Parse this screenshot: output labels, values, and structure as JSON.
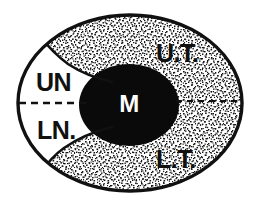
{
  "diagram": {
    "type": "anatomical-schematic",
    "background_color": "#ffffff",
    "outline_color": "#111111",
    "core_fill_color": "#0a0a0a",
    "core_text_color": "#ffffff",
    "stipple_color": "#151515",
    "plain_fill_color": "#ffffff",
    "labels": {
      "core": "M",
      "upper_right": "U.T.",
      "lower_right": "L.T.",
      "upper_left": "UN",
      "lower_left": "LN."
    },
    "regions": [
      {
        "id": "core",
        "label": "M",
        "fill": "solid-black",
        "location": "center"
      },
      {
        "id": "upper-tube",
        "label": "U.T.",
        "fill": "stippled",
        "location": "upper-right"
      },
      {
        "id": "lower-tube",
        "label": "L.T.",
        "fill": "stippled",
        "location": "lower-right"
      },
      {
        "id": "upper-notch",
        "label": "UN",
        "fill": "white",
        "location": "upper-left"
      },
      {
        "id": "lower-notch",
        "label": "LN.",
        "fill": "white",
        "location": "lower-left"
      }
    ],
    "divider": {
      "style": "dashed",
      "color": "#111111",
      "description": "horizontal dashed midline separating upper and lower halves"
    }
  }
}
